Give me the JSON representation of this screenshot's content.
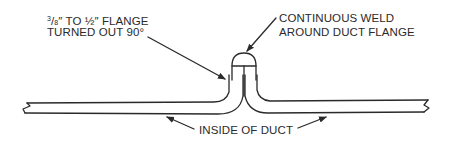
{
  "diagram": {
    "type": "duct flange weld detail",
    "colors": {
      "line": "#2a2a2a",
      "background": "#ffffff"
    },
    "labels": {
      "flange_line1_prefix_num": "3",
      "flange_line1_prefix_den": "8",
      "flange_line1_rest": "″ TO ½″ FLANGE",
      "flange_line2": "TURNED OUT 90°",
      "weld_line1": "CONTINUOUS WELD",
      "weld_line2": "AROUND DUCT FLANGE",
      "inside": "INSIDE OF DUCT"
    }
  }
}
